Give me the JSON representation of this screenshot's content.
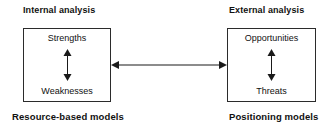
{
  "diagram": {
    "colors": {
      "background": "#ffffff",
      "stroke": "#1a1a1a",
      "box_border": "#2b2b2b",
      "text": "#111111"
    },
    "left": {
      "heading": "Internal analysis",
      "caption": "Resource-based models",
      "top_item": "Strengths",
      "bottom_item": "Weaknesses",
      "arrow": "vertical-double-arrow"
    },
    "right": {
      "heading": "External analysis",
      "caption": "Positioning models",
      "top_item": "Opportunities",
      "bottom_item": "Threats",
      "arrow": "vertical-double-arrow"
    },
    "connector": {
      "type": "horizontal-double-arrow",
      "label": ""
    }
  }
}
